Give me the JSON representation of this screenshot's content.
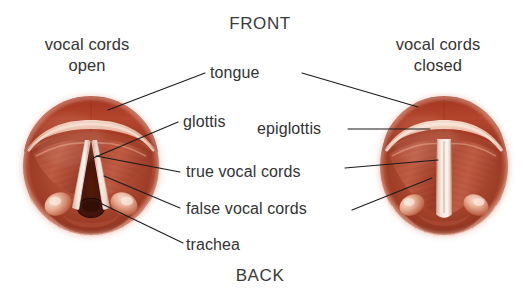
{
  "figure": {
    "type": "anatomical-illustration"
  },
  "orientation": {
    "front_label": "FRONT",
    "back_label": "BACK"
  },
  "captions": {
    "left": "vocal cords\nopen",
    "right": "vocal cords\nclosed"
  },
  "labels": {
    "tongue": "tongue",
    "glottis": "glottis",
    "epiglottis": "epiglottis",
    "true_vocal_cords": "true vocal cords",
    "false_vocal_cords": "false vocal cords",
    "trachea": "trachea"
  },
  "colors": {
    "background": "#ffffff",
    "text": "#333333",
    "leader_line": "#1a1a1a",
    "tissue_dark": "#8a2e1e",
    "tissue_mid": "#b04a32",
    "tissue_light": "#d98a70",
    "tissue_pale": "#eec3b2",
    "cord_pale": "#f2e2d8",
    "glottis_void": "#4a1608",
    "rim_outer": "#c05a40"
  },
  "structures": {
    "left_view": {
      "state": "open",
      "glottis_shape": "triangular-open",
      "visible_parts": [
        "tongue",
        "glottis",
        "true vocal cords",
        "false vocal cords",
        "trachea"
      ]
    },
    "right_view": {
      "state": "closed",
      "glottis_shape": "narrow-slit",
      "visible_parts": [
        "tongue",
        "epiglottis",
        "true vocal cords",
        "false vocal cords"
      ]
    }
  }
}
